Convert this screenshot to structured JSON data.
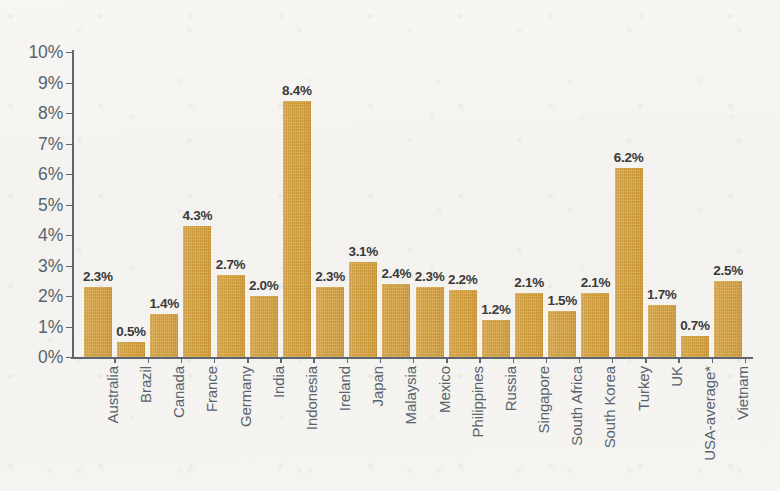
{
  "chart_data": {
    "type": "bar",
    "title": "",
    "subtitle": "",
    "xlabel": "",
    "ylabel": "",
    "ylim": [
      0,
      10
    ],
    "ytick_labels": [
      "0%",
      "1%",
      "2%",
      "3%",
      "4%",
      "5%",
      "6%",
      "7%",
      "8%",
      "9%",
      "10%"
    ],
    "ytick_values": [
      0,
      1,
      2,
      3,
      4,
      5,
      6,
      7,
      8,
      9,
      10
    ],
    "grid": false,
    "legend": null,
    "bar_color": "#d9a441",
    "label_color": "#3a3a3a",
    "axis_color": "#5c6670",
    "background_color": "#f4f3ef",
    "categories": [
      "Australia",
      "Brazil",
      "Canada",
      "France",
      "Germany",
      "India",
      "Indonesia",
      "Ireland",
      "Japan",
      "Malaysia",
      "Mexico",
      "Philippines",
      "Russia",
      "Singapore",
      "South Africa",
      "South Korea",
      "Turkey",
      "UK",
      "USA-average*",
      "Vietnam"
    ],
    "values": [
      2.3,
      0.5,
      1.4,
      4.3,
      2.7,
      2.0,
      8.4,
      2.3,
      3.1,
      2.4,
      2.3,
      2.2,
      1.2,
      2.1,
      1.5,
      2.1,
      6.2,
      1.7,
      0.7,
      2.5
    ],
    "value_labels": [
      "2.3%",
      "0.5%",
      "1.4%",
      "4.3%",
      "2.7%",
      "2.0%",
      "8.4%",
      "2.3%",
      "3.1%",
      "2.4%",
      "2.3%",
      "2.2%",
      "1.2%",
      "2.1%",
      "1.5%",
      "2.1%",
      "6.2%",
      "1.7%",
      "0.7%",
      "2.5%"
    ]
  }
}
